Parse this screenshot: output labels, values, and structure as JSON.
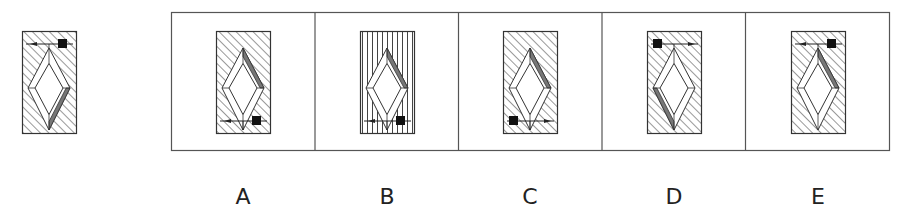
{
  "puzzle": {
    "question_figure": {
      "id": "question",
      "fill": "diagonal",
      "gray_facet": "bottom-right",
      "arrow": {
        "position": "top",
        "square_side": "right",
        "arrowhead_side": "left"
      }
    },
    "options": [
      {
        "label": "A",
        "fill": "diagonal",
        "gray_facet": "top-right",
        "arrow": {
          "position": "bottom",
          "square_side": "right",
          "arrowhead_side": "left"
        }
      },
      {
        "label": "B",
        "fill": "vertical",
        "gray_facet": "top-right",
        "arrow": {
          "position": "bottom",
          "square_side": "right",
          "arrowhead_side": "left"
        }
      },
      {
        "label": "C",
        "fill": "diagonal",
        "gray_facet": "top-right",
        "arrow": {
          "position": "bottom",
          "square_side": "left",
          "arrowhead_side": "right"
        }
      },
      {
        "label": "D",
        "fill": "diagonal",
        "gray_facet": "bottom-left",
        "arrow": {
          "position": "top",
          "square_side": "left",
          "arrowhead_side": "right"
        }
      },
      {
        "label": "E",
        "fill": "diagonal",
        "gray_facet": "top-right",
        "arrow": {
          "position": "top",
          "square_side": "right",
          "arrowhead_side": "left"
        }
      }
    ]
  },
  "colors": {
    "stroke": "#333333",
    "hatch": "#444444",
    "gray_facet": "#777777",
    "square": "#111111",
    "frame": "#555555"
  }
}
